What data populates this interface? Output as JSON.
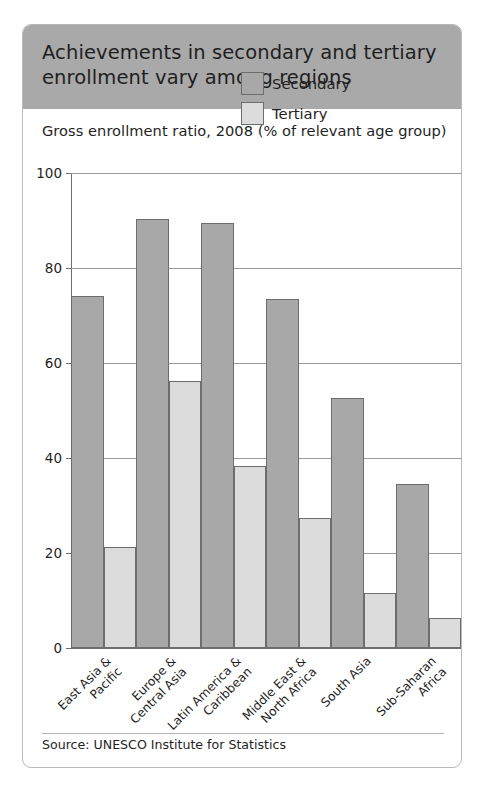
{
  "header": {
    "title": "Achievements in secondary and tertiary enrollment vary among regions"
  },
  "subtitle": "Gross enrollment ratio, 2008 (% of relevant age group)",
  "source": "Source: UNESCO Institute for Statistics",
  "legend": {
    "items": [
      {
        "label": "Secondary",
        "color": "#a8a8a8"
      },
      {
        "label": "Tertiary",
        "color": "#dcdcdc"
      }
    ]
  },
  "axis": {
    "y_ticks": [
      "0",
      "20",
      "40",
      "60",
      "80",
      "100"
    ]
  },
  "colors": {
    "header_band": "#a9a9a9",
    "secondary_bar": "#a8a8a8",
    "tertiary_bar": "#dcdcdc",
    "bar_outline": "#6d6d6d",
    "gridline": "#9a9a9a",
    "text": "#1f1f1f",
    "card_border": "#b9b9b9"
  },
  "chart_data": {
    "type": "bar",
    "title": "Achievements in secondary and tertiary enrollment vary among regions",
    "subtitle": "Gross enrollment ratio, 2008 (% of relevant age group)",
    "xlabel": "",
    "ylabel": "",
    "ylim": [
      0,
      100
    ],
    "yticks": [
      0,
      20,
      40,
      60,
      80,
      100
    ],
    "grid": true,
    "legend_position": "inside-top-right",
    "categories": [
      "East Asia & Pacific",
      "Europe & Central Asia",
      "Latin America & Caribbean",
      "Middle East & North Africa",
      "South Asia",
      "Sub-Saharan Africa"
    ],
    "categories_lines": [
      [
        "East Asia &",
        "Pacific"
      ],
      [
        "Europe &",
        "Central Asia"
      ],
      [
        "Latin America &",
        "Caribbean"
      ],
      [
        "Middle East &",
        "North Africa"
      ],
      [
        "South Asia",
        ""
      ],
      [
        "Sub-Saharan",
        "Africa"
      ]
    ],
    "series": [
      {
        "name": "Secondary",
        "color": "#a8a8a8",
        "values": [
          74.2,
          90.3,
          89.4,
          73.4,
          52.6,
          34.5
        ]
      },
      {
        "name": "Tertiary",
        "color": "#dcdcdc",
        "values": [
          21.2,
          56.2,
          38.4,
          27.4,
          11.5,
          6.4
        ]
      }
    ],
    "source": "Source: UNESCO Institute for Statistics"
  }
}
